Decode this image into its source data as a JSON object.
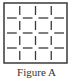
{
  "figure": {
    "caption": "Figure A",
    "grid_divisions": 4,
    "stroke_color": "#3a3a3a"
  }
}
